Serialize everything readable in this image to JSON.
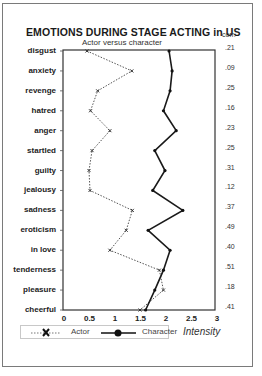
{
  "chart_data": {
    "type": "line",
    "title": "EMOTIONS DURING STAGE ACTING in US",
    "subtitle": "Actor versus character",
    "xlabel": "Intensity",
    "ylabel": "",
    "xlim": [
      0,
      3
    ],
    "xticks": [
      "0",
      "0.5",
      "1",
      "1.5",
      "2",
      "2.5",
      "3"
    ],
    "categories": [
      "disgust",
      "anxiety",
      "revenge",
      "hatred",
      "anger",
      "startled",
      "guilty",
      "jealousy",
      "sadness",
      "eroticism",
      "in love",
      "tenderness",
      "pleasure",
      "cheerful"
    ],
    "series": [
      {
        "name": "Actor",
        "style": "dotted",
        "marker": "x",
        "values": [
          0.45,
          1.33,
          0.66,
          0.52,
          0.9,
          0.55,
          0.49,
          0.51,
          1.34,
          1.22,
          0.9,
          1.87,
          1.95,
          1.49
        ]
      },
      {
        "name": "Character",
        "style": "solid",
        "marker": "dot",
        "values": [
          2.06,
          2.12,
          2.08,
          1.95,
          2.2,
          1.78,
          1.98,
          1.74,
          2.33,
          1.65,
          2.08,
          1.95,
          1.78,
          1.6
        ]
      }
    ],
    "annotations": {
      "right_column_header": "corr.",
      "correlations": [
        ".21",
        ".09",
        ".25",
        ".16",
        ".23",
        ".25",
        ".31",
        ".12",
        ".37",
        ".49",
        ".40",
        ".51",
        ".18",
        ".41"
      ]
    },
    "grid": false,
    "legend_position": "bottom"
  },
  "legend": {
    "actor": "Actor",
    "character": "Character"
  },
  "colors": {
    "actor": "#555555",
    "character": "#1a1a1a",
    "frame": "#7a7a7a"
  }
}
